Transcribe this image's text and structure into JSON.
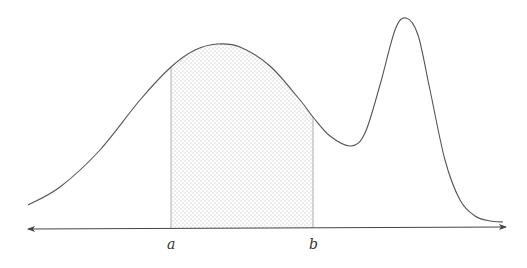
{
  "diagram": {
    "labels": {
      "a": "a",
      "b": "b"
    },
    "colors": {
      "curve": "#555555",
      "axis": "#444444",
      "shade_dot": "#b0b0b0",
      "bound_line": "#999999"
    },
    "axis": {
      "y": 229,
      "x_start": 28,
      "x_end": 506,
      "arrows": "both"
    },
    "bounds": {
      "a_x": 171,
      "b_x": 313
    },
    "curve_points": [
      [
        28,
        205
      ],
      [
        60,
        187
      ],
      [
        100,
        150
      ],
      [
        140,
        100
      ],
      [
        171,
        67
      ],
      [
        195,
        50
      ],
      [
        217,
        44
      ],
      [
        240,
        47
      ],
      [
        270,
        66
      ],
      [
        300,
        100
      ],
      [
        313,
        117
      ],
      [
        330,
        136
      ],
      [
        351,
        146
      ],
      [
        365,
        133
      ],
      [
        380,
        85
      ],
      [
        395,
        30
      ],
      [
        406,
        18
      ],
      [
        418,
        35
      ],
      [
        430,
        90
      ],
      [
        445,
        160
      ],
      [
        460,
        200
      ],
      [
        475,
        216
      ],
      [
        490,
        221
      ],
      [
        503,
        222
      ]
    ]
  }
}
